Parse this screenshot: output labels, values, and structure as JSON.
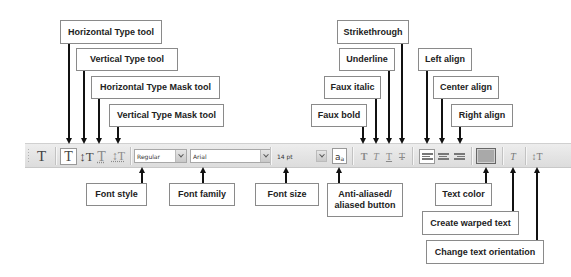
{
  "callouts_top": [
    {
      "id": "horizontal-type-tool",
      "label": "Horizontal Type tool",
      "box": [
        60,
        20,
        102,
        24
      ],
      "arrow_x": 69
    },
    {
      "id": "vertical-type-tool",
      "label": "Vertical Type tool",
      "box": [
        76,
        48,
        102,
        23
      ],
      "arrow_x": 84
    },
    {
      "id": "horizontal-type-mask-tool",
      "label": "Horizontal Type Mask tool",
      "box": [
        91,
        76,
        129,
        23
      ],
      "arrow_x": 99
    },
    {
      "id": "vertical-type-mask-tool",
      "label": "Vertical Type Mask tool",
      "box": [
        109,
        104,
        115,
        23
      ],
      "arrow_x": 118
    },
    {
      "id": "strikethrough",
      "label": "Strikethrough",
      "box": [
        337,
        20,
        72,
        24
      ],
      "arrow_x": 402
    },
    {
      "id": "underline",
      "label": "Underline",
      "box": [
        339,
        48,
        56,
        23
      ],
      "arrow_x": 389
    },
    {
      "id": "faux-italic",
      "label": "Faux italic",
      "box": [
        324,
        76,
        57,
        23
      ],
      "arrow_x": 376
    },
    {
      "id": "faux-bold",
      "label": "Faux bold",
      "box": [
        311,
        104,
        56,
        23
      ],
      "arrow_x": 363
    },
    {
      "id": "left-align",
      "label": "Left align",
      "box": [
        418,
        48,
        54,
        23
      ],
      "arrow_x": 427
    },
    {
      "id": "center-align",
      "label": "Center align",
      "box": [
        433,
        76,
        66,
        23
      ],
      "arrow_x": 442
    },
    {
      "id": "right-align",
      "label": "Right align",
      "box": [
        451,
        104,
        62,
        23
      ],
      "arrow_x": 460
    }
  ],
  "callouts_bottom": [
    {
      "id": "font-style",
      "label": "Font style",
      "box": [
        86,
        183,
        61,
        23
      ],
      "arrow_x": 142
    },
    {
      "id": "font-family",
      "label": "Font family",
      "box": [
        169,
        183,
        66,
        23
      ],
      "arrow_x": 203
    },
    {
      "id": "font-size",
      "label": "Font size",
      "box": [
        255,
        183,
        64,
        23
      ],
      "arrow_x": 286
    },
    {
      "id": "anti-aliased",
      "label": "Anti-aliased/\naliased button",
      "box": [
        327,
        183,
        76,
        34
      ],
      "arrow_x": 339
    },
    {
      "id": "text-color",
      "label": "Text color",
      "box": [
        435,
        183,
        57,
        23
      ],
      "arrow_x": 486
    },
    {
      "id": "create-warped-text",
      "label": "Create warped text",
      "box": [
        422,
        211,
        97,
        24
      ],
      "arrow_x": 513
    },
    {
      "id": "change-text-orientation",
      "label": "Change text orientation",
      "box": [
        426,
        240,
        118,
        24
      ],
      "arrow_x": 537
    }
  ],
  "toolbar": {
    "preset_glyph": "T",
    "tools": [
      {
        "name": "horizontal-type",
        "glyph": "T",
        "active": true
      },
      {
        "name": "vertical-type",
        "glyph": "↕T",
        "active": false
      },
      {
        "name": "horizontal-type-mask",
        "glyph": "T",
        "active": false
      },
      {
        "name": "vertical-type-mask",
        "glyph": "↕T",
        "active": false
      }
    ],
    "font_style": {
      "value": "Regular"
    },
    "font_family": {
      "value": "Arial"
    },
    "font_size": {
      "value": "14 pt"
    },
    "anti_alias": {
      "glyph": "a",
      "sub": "a"
    },
    "format_buttons": [
      {
        "name": "faux-bold",
        "glyph": "T"
      },
      {
        "name": "faux-italic",
        "glyph": "T"
      },
      {
        "name": "underline",
        "glyph": "T"
      },
      {
        "name": "strikethrough",
        "glyph": "T"
      }
    ],
    "text_color": "#a9a9a9",
    "warp_glyph": "T",
    "orientation_glyph": "↕T"
  },
  "colors": {
    "toolbar_bg": "#e4e4e4",
    "callout_border": "#8a8a8a",
    "arrow": "#111111"
  }
}
